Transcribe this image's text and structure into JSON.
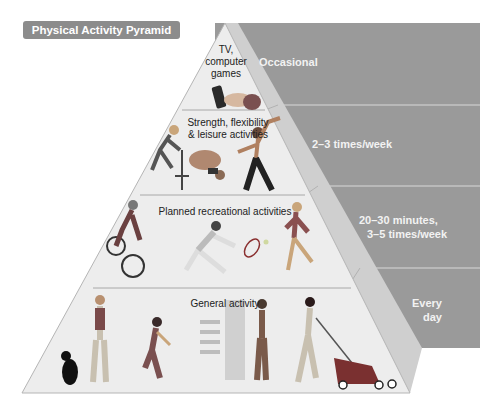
{
  "title": "Physical Activity Pyramid",
  "colors": {
    "badge_bg": "#8c8c8c",
    "panel_bg": "#9a9a9a",
    "front_face": "#ededed",
    "side_face": "#cfcfcf",
    "divider": "#dcdcdc"
  },
  "tiers": [
    {
      "label": "TV, computer games",
      "label_lines": [
        "TV,",
        "computer",
        "games"
      ],
      "frequency": "Occasional",
      "figures": [
        "remote-control",
        "hand-on-couch"
      ]
    },
    {
      "label": "Strength, flexibility & leisure activities",
      "label_lines": [
        "Strength, flexibility",
        "& leisure activities"
      ],
      "frequency": "2–3 times/week",
      "figures": [
        "weightlifter",
        "stretching-person",
        "martial-artist"
      ]
    },
    {
      "label": "Planned recreational activities",
      "label_lines": [
        "Planned recreational activities"
      ],
      "frequency_lines": [
        "20–30 minutes,",
        "3–5 times/week"
      ],
      "frequency": "20–30 minutes, 3–5 times/week",
      "figures": [
        "cyclist",
        "tennis-player",
        "runner"
      ]
    },
    {
      "label": "General activity",
      "label_lines": [
        "General activity"
      ],
      "frequency_lines": [
        "Every",
        "day"
      ],
      "frequency": "Every day",
      "figures": [
        "woman-walking-dog",
        "woman-gardening",
        "boy-taking-stairs",
        "man-mowing-lawn"
      ]
    }
  ]
}
